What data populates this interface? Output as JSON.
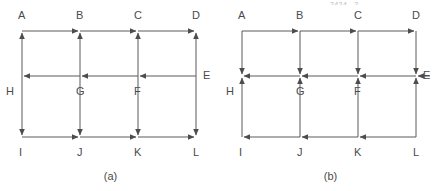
{
  "page": {
    "background_color": "#ffffff",
    "line_color": "#555555",
    "text_color": "#4a4a4a",
    "width": 441,
    "height": 191
  },
  "header_fragment": {
    "left_text": "2424...2...",
    "right_text": "..."
  },
  "figures": [
    {
      "id": "a",
      "caption": "(a)",
      "nodes": [
        {
          "name": "A",
          "label": "A",
          "x": 22,
          "y": 31,
          "label_x": 18,
          "label_y": 10
        },
        {
          "name": "B",
          "label": "B",
          "x": 80,
          "y": 31,
          "label_x": 76,
          "label_y": 10
        },
        {
          "name": "C",
          "label": "C",
          "x": 138,
          "y": 31,
          "label_x": 134,
          "label_y": 10
        },
        {
          "name": "D",
          "label": "D",
          "x": 196,
          "y": 31,
          "label_x": 192,
          "label_y": 10
        },
        {
          "name": "E",
          "label": "E",
          "x": 196,
          "y": 76,
          "label_x": 203,
          "label_y": 70
        },
        {
          "name": "F",
          "label": "F",
          "x": 138,
          "y": 76,
          "label_x": 134,
          "label_y": 86
        },
        {
          "name": "G",
          "label": "G",
          "x": 80,
          "y": 76,
          "label_x": 76,
          "label_y": 86
        },
        {
          "name": "H",
          "label": "H",
          "x": 22,
          "y": 76,
          "label_x": 6,
          "label_y": 86
        },
        {
          "name": "I",
          "label": "I",
          "x": 22,
          "y": 137,
          "label_x": 19,
          "label_y": 147
        },
        {
          "name": "J",
          "label": "J",
          "x": 80,
          "y": 137,
          "label_x": 77,
          "label_y": 147
        },
        {
          "name": "K",
          "label": "K",
          "x": 138,
          "y": 137,
          "label_x": 134,
          "label_y": 147
        },
        {
          "name": "L",
          "label": "L",
          "x": 196,
          "y": 137,
          "label_x": 193,
          "label_y": 147
        }
      ],
      "arrow_summary": {
        "top_row": "rightward into B, C, D",
        "middle_row": "leftward into H, G, F",
        "bottom_row": "rightward into J, K, L",
        "columns": "arrowheads at both top and bottom ends"
      }
    },
    {
      "id": "b",
      "caption": "(b)",
      "nodes": [
        {
          "name": "A",
          "label": "A",
          "x": 22,
          "y": 31,
          "label_x": 18,
          "label_y": 10
        },
        {
          "name": "B",
          "label": "B",
          "x": 80,
          "y": 31,
          "label_x": 76,
          "label_y": 10
        },
        {
          "name": "C",
          "label": "C",
          "x": 138,
          "y": 31,
          "label_x": 134,
          "label_y": 10
        },
        {
          "name": "D",
          "label": "D",
          "x": 196,
          "y": 31,
          "label_x": 192,
          "label_y": 10
        },
        {
          "name": "E",
          "label": "E",
          "x": 196,
          "y": 76,
          "label_x": 203,
          "label_y": 70
        },
        {
          "name": "F",
          "label": "F",
          "x": 138,
          "y": 76,
          "label_x": 134,
          "label_y": 86
        },
        {
          "name": "G",
          "label": "G",
          "x": 80,
          "y": 76,
          "label_x": 76,
          "label_y": 86
        },
        {
          "name": "H",
          "label": "H",
          "x": 22,
          "y": 76,
          "label_x": 6,
          "label_y": 86
        },
        {
          "name": "I",
          "label": "I",
          "x": 22,
          "y": 137,
          "label_x": 19,
          "label_y": 147
        },
        {
          "name": "J",
          "label": "J",
          "x": 80,
          "y": 137,
          "label_x": 77,
          "label_y": 147
        },
        {
          "name": "K",
          "label": "K",
          "x": 138,
          "y": 137,
          "label_x": 134,
          "label_y": 147
        },
        {
          "name": "L",
          "label": "L",
          "x": 196,
          "y": 137,
          "label_x": 193,
          "label_y": 147
        }
      ],
      "arrow_summary": {
        "top_row": "rightward into B, C, D",
        "middle_row": "leftward into H, G, F, and into E",
        "bottom_row": "leftward into I, J, K",
        "columns": "arrowheads converge on the middle row from above and below"
      }
    }
  ]
}
